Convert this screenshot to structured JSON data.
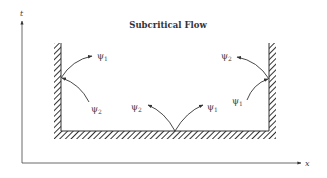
{
  "title": "Subcritical Flow",
  "axes": {
    "x_label": "x",
    "y_label": "t"
  },
  "colors": {
    "line": "#333333",
    "hatch": "#333333",
    "text": "#444444",
    "background": "#ffffff"
  },
  "characteristics": {
    "left_wall": {
      "outgoing": {
        "symbol": "ψ",
        "subscript": "1"
      },
      "incoming": {
        "symbol": "ψ",
        "subscript": "2"
      }
    },
    "bottom": {
      "left": {
        "symbol": "ψ",
        "subscript": "2"
      },
      "right": {
        "symbol": "ψ",
        "subscript": "1"
      }
    },
    "right_wall": {
      "outgoing": {
        "symbol": "ψ",
        "subscript": "2"
      },
      "incoming": {
        "symbol": "ψ",
        "subscript": "1"
      }
    }
  }
}
